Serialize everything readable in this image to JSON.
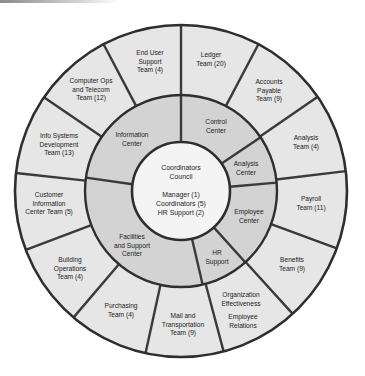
{
  "diagram": {
    "type": "radial-org-chart",
    "colors": {
      "outer_ring": "#e6e6e6",
      "middle_ring": "#d3d3d3",
      "center": "#f4f4f4",
      "lines": "#2e2e2e"
    },
    "center": {
      "title": "Coordinators\nCouncil",
      "roles": "Manager (1)\nCoordinators (5)\nHR Support (2)"
    },
    "centers": [
      {
        "label": "Information\nCenter"
      },
      {
        "label": "Control\nCenter"
      },
      {
        "label": "Analysis\nCenter"
      },
      {
        "label": "Employee\nCenter"
      },
      {
        "label": "HR\nSupport"
      },
      {
        "label": "Facilities\nand Support\nCenter"
      }
    ],
    "teams": [
      {
        "label": "End User\nSupport\nTeam (4)"
      },
      {
        "label": "Ledger\nTeam (20)"
      },
      {
        "label": "Accounts\nPayable\nTeam (9)"
      },
      {
        "label": "Analysis\nTeam (4)"
      },
      {
        "label": "Payroll\nTeam (11)"
      },
      {
        "label": "Benefits\nTeam (9)"
      },
      {
        "label": "Organization\nEffectiveness"
      },
      {
        "label": "Employee\nRelations"
      },
      {
        "label": "Mail and\nTransportation\nTeam (9)"
      },
      {
        "label": "Purchasing\nTeam (4)"
      },
      {
        "label": "Building\nOperations\nTeam (4)"
      },
      {
        "label": "Customer\nInformation\nCenter Team (5)"
      },
      {
        "label": "Info Systems\nDevelopment\nTeam (13)"
      },
      {
        "label": "Computer Ops\nand Telecom\nTeam (12)"
      }
    ]
  }
}
